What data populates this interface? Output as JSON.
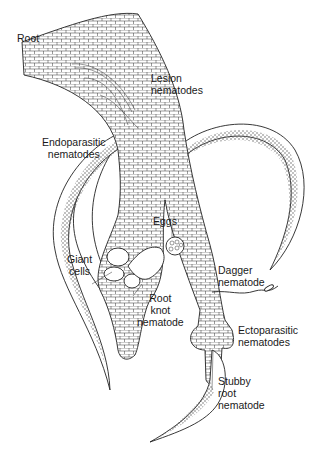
{
  "figure": {
    "type": "line-drawing",
    "colors": {
      "ink": "#222222",
      "background": "#ffffff"
    }
  },
  "labels": {
    "root": "Root",
    "lesion": "Lesion\nnematodes",
    "endoparasitic": "Endoparasitic\nnematodes",
    "eggs": "Eggs",
    "giant_cells": "Giant\ncells",
    "root_knot": "Root\nknot\nnematode",
    "dagger": "Dagger\nnematode",
    "ectoparasitic": "Ectoparasitic\nnematodes",
    "stubby_root": "Stubby\nroot\nnematode"
  }
}
